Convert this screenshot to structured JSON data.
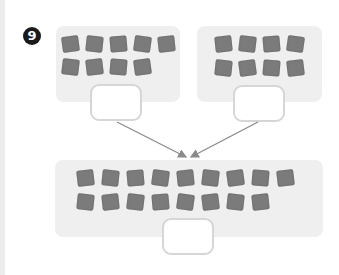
{
  "question": {
    "number": "9"
  },
  "groups": [
    {
      "name": "left-group",
      "count": 9,
      "rows": [
        5,
        4
      ],
      "answer": ""
    },
    {
      "name": "right-group",
      "count": 8,
      "rows": [
        4,
        4
      ],
      "answer": ""
    }
  ],
  "total": {
    "name": "total-group",
    "count": 17,
    "rows": [
      9,
      8
    ],
    "answer": ""
  },
  "colors": {
    "panel": "#efefef",
    "tile": "#7b7b7b",
    "answer_border": "#d6d6d6",
    "arrow": "#8a8a8a",
    "badge": "#1a1a1a"
  }
}
